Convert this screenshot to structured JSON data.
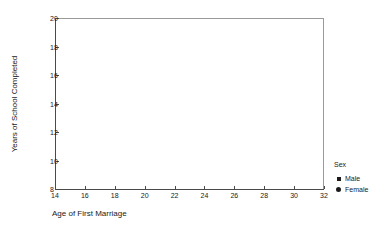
{
  "chart_data": {
    "type": "scatter",
    "title": "",
    "subtitle": "",
    "xlabel": "Age of First Marriage",
    "ylabel": "Years of School Completed",
    "xlim": [
      14,
      32
    ],
    "ylim": [
      8,
      20
    ],
    "xticks": [
      14,
      16,
      18,
      20,
      22,
      24,
      26,
      28,
      30,
      32
    ],
    "xticklabels": [
      "14",
      "16",
      "18",
      "20",
      "22",
      "24",
      "26",
      "28",
      "30",
      "32"
    ],
    "yticks": [
      8,
      10,
      12,
      14,
      16,
      18,
      20
    ],
    "yticklabels": [
      "8",
      "10",
      "12",
      "14",
      "16",
      "18",
      "20"
    ],
    "grid": false,
    "frame": true,
    "legend_position": "right",
    "series": [
      {
        "name": "Male",
        "marker": "square",
        "color": "#1a1a1a",
        "x": [],
        "y": []
      },
      {
        "name": "Female",
        "marker": "circle",
        "color": "#1a1a1a",
        "x": [],
        "y": []
      }
    ],
    "annotations": []
  },
  "legend": {
    "title": "Sex",
    "items": [
      {
        "label": "Male",
        "marker": "square-marker-icon"
      },
      {
        "label": "Female",
        "marker": "circle-marker-icon"
      }
    ]
  },
  "colors": {
    "background": "#ffffff",
    "frame": "#9a9a9a",
    "axis": "#4a4a4a",
    "text": "#1a1a1a",
    "marker": "#1a1a1a"
  }
}
